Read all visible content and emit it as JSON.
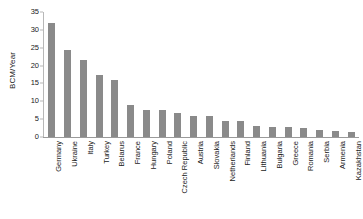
{
  "chart_data": {
    "type": "bar",
    "title": "",
    "subtitle": "",
    "xlabel": "",
    "ylabel": "BCM/Year",
    "ylim": [
      0,
      35
    ],
    "yticks": [
      0,
      5,
      10,
      15,
      20,
      25,
      30,
      35
    ],
    "ytick_labels": [
      "0",
      "5",
      "10",
      "15",
      "20",
      "25",
      "30",
      "35"
    ],
    "grid": false,
    "legend": null,
    "bar_color": "#8a8a8a",
    "axis_color": "#9a9a9a",
    "text_color": "#1a1a1a",
    "categories": [
      "Germany",
      "Ukraine",
      "Italy",
      "Turkey",
      "Belarus",
      "France",
      "Hungary",
      "Poland",
      "Czech Republic",
      "Austria",
      "Slovakia",
      "Netherlands",
      "Finland",
      "Lithuania",
      "Bulgaria",
      "Greece",
      "Romania",
      "Serbia",
      "Armenia",
      "Kazakhstan"
    ],
    "values": [
      31.8,
      24.5,
      21.5,
      17.5,
      16.0,
      9.0,
      7.6,
      7.5,
      6.6,
      6.0,
      5.8,
      4.6,
      4.4,
      3.0,
      2.9,
      2.8,
      2.5,
      1.9,
      1.8,
      1.3
    ]
  }
}
